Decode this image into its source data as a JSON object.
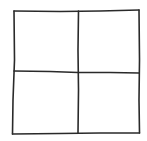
{
  "diagram": {
    "type": "grid",
    "rows": 2,
    "columns": 2,
    "style": "hand-drawn",
    "stroke_color": "#2a2a2a",
    "background_color": "#ffffff",
    "cells": [
      {
        "row": 1,
        "col": 1,
        "label": ""
      },
      {
        "row": 1,
        "col": 2,
        "label": ""
      },
      {
        "row": 2,
        "col": 1,
        "label": ""
      },
      {
        "row": 2,
        "col": 2,
        "label": ""
      }
    ]
  }
}
